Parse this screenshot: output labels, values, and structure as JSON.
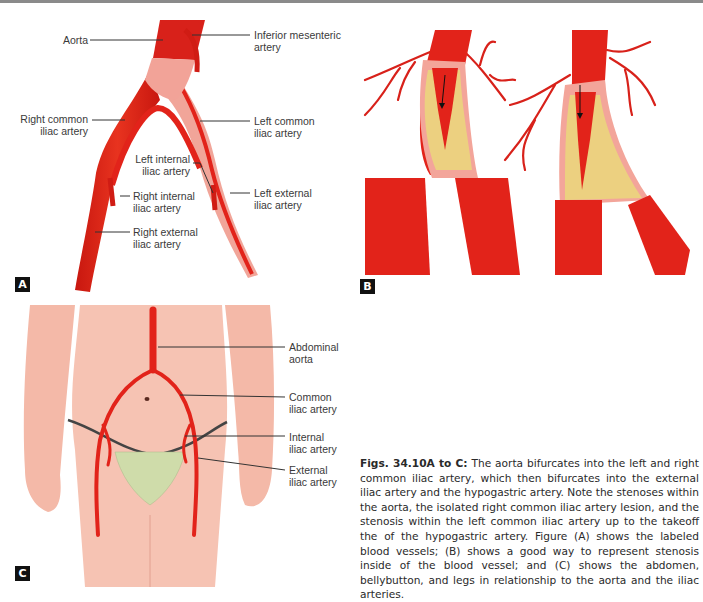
{
  "figure": {
    "panels": {
      "A": {
        "tag": "A",
        "labels": {
          "aorta": "Aorta",
          "inferior_mesenteric": "Inferior mesenteric\nartery",
          "right_common_iliac": "Right common\niliac artery",
          "left_common_iliac": "Left common\niliac artery",
          "left_internal_iliac": "Left internal\niliac artery",
          "right_internal_iliac": "Right internal\niliac artery",
          "left_external_iliac": "Left external\niliac artery",
          "right_external_iliac": "Right external\niliac artery"
        }
      },
      "B": {
        "tag": "B"
      },
      "C": {
        "tag": "C",
        "labels": {
          "abdominal_aorta": "Abdominal\naorta",
          "common_iliac": "Common\niliac artery",
          "internal_iliac": "Internal\niliac artery",
          "external_iliac": "External\niliac artery"
        }
      }
    },
    "caption": {
      "title": "Figs. 34.10A to C:",
      "text": " The aorta bifurcates into the left and right common iliac artery, which then bifurcates into the external iliac artery and the hypogastric artery. Note the stenoses within the aorta, the isolated right common iliac artery lesion, and the stenosis within the left common iliac artery up to the takeoff the of the hypogastric artery. Figure (A) shows the labeled blood vessels; (B) shows a good way to represent stenosis inside of the blood vessel; and (C) shows the abdomen, bellybutton, and legs in relationship to the aorta and the iliac arteries."
    },
    "colors": {
      "artery": "#e2231a",
      "artery_dark": "#b81710",
      "vessel_wall": "#f3a59a",
      "plaque": "#ecd080",
      "skin": "#f4b9a8",
      "mesh": "#cfdcaa",
      "tag_bg": "#111111"
    }
  }
}
